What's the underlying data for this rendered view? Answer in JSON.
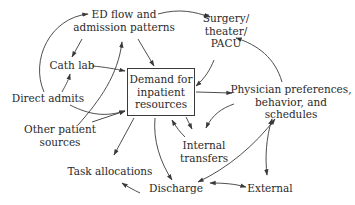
{
  "diagram": {
    "center_node": {
      "lines": [
        "Demand for",
        "inpatient",
        "resources"
      ]
    },
    "nodes": {
      "ed_flow": {
        "lines": [
          "ED flow and",
          "admission patterns"
        ]
      },
      "surgery": {
        "lines": [
          "Surgery/",
          "theater/",
          "PACU"
        ]
      },
      "cath_lab": {
        "lines": [
          "Cath lab"
        ]
      },
      "direct_admits": {
        "lines": [
          "Direct admits"
        ]
      },
      "other_sources": {
        "lines": [
          "Other patient",
          "sources"
        ]
      },
      "physician": {
        "lines": [
          "Physician preferences,",
          "behavior, and",
          "schedules"
        ]
      },
      "internal_transfers": {
        "lines": [
          "Internal",
          "transfers"
        ]
      },
      "task_allocations": {
        "lines": [
          "Task allocations"
        ]
      },
      "discharge": {
        "lines": [
          "Discharge"
        ]
      },
      "external": {
        "lines": [
          "External"
        ]
      }
    },
    "colors": {
      "stroke": "#3a3a3a",
      "text": "#2a2a2a",
      "background": "#ffffff"
    }
  }
}
